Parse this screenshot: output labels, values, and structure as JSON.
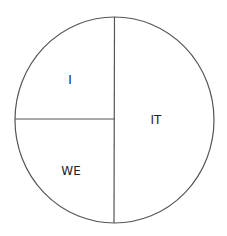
{
  "diagram": {
    "type": "divided-circle",
    "stroke_color": "#555555",
    "background": "#ffffff",
    "text_color": "#222222",
    "circle": {
      "cx": 114.5,
      "cy": 120,
      "rx": 99.5,
      "ry": 103
    },
    "dividers": {
      "vertical": {
        "x": 114.5,
        "y1": 17,
        "y2": 223
      },
      "horizontal": {
        "x1": 15,
        "x2": 114.5,
        "y": 119
      }
    },
    "quadrants": [
      {
        "id": "upper-left",
        "label": "I",
        "x": 70,
        "y": 84
      },
      {
        "id": "right-half",
        "label": "IT",
        "x": 156,
        "y": 124
      },
      {
        "id": "lower-left",
        "label": "WE",
        "x": 71,
        "y": 175
      }
    ]
  }
}
